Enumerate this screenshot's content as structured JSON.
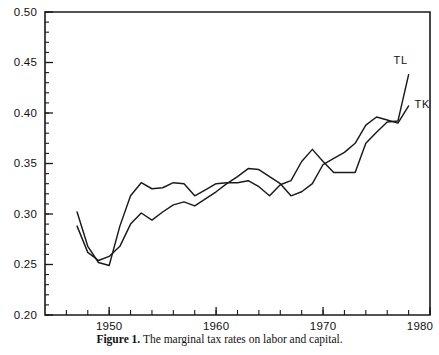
{
  "figure": {
    "caption_label": "Figure 1.",
    "caption_text": "The marginal tax rates on labor and capital."
  },
  "chart_data": {
    "type": "line",
    "title": "",
    "xlabel": "",
    "ylabel": "",
    "xlim": [
      1944,
      1980
    ],
    "ylim": [
      0.2,
      0.5
    ],
    "grid": false,
    "legend_position": "inline-right-end-labels",
    "y_ticks": [
      0.2,
      0.25,
      0.3,
      0.35,
      0.4,
      0.45,
      0.5
    ],
    "y_tick_labels": [
      "0.20",
      "0.25",
      "0.30",
      "0.35",
      "0.40",
      "0.45",
      "0.50"
    ],
    "y_minor_tick_step": 0.01,
    "x_ticks": [
      1950,
      1960,
      1970,
      1980
    ],
    "x_tick_labels": [
      "1950",
      "1960",
      "1970",
      "1980"
    ],
    "x_minor_tick_step": 2,
    "x": [
      1947,
      1948,
      1949,
      1950,
      1951,
      1952,
      1953,
      1954,
      1955,
      1956,
      1957,
      1958,
      1959,
      1960,
      1961,
      1962,
      1963,
      1964,
      1965,
      1966,
      1967,
      1968,
      1969,
      1970,
      1971,
      1972,
      1973,
      1974,
      1975,
      1976,
      1977,
      1978
    ],
    "series": [
      {
        "name": "TL",
        "label": "TL",
        "values": [
          0.302,
          0.268,
          0.252,
          0.249,
          0.288,
          0.318,
          0.331,
          0.325,
          0.326,
          0.331,
          0.33,
          0.318,
          0.324,
          0.33,
          0.331,
          0.331,
          0.333,
          0.327,
          0.318,
          0.329,
          0.333,
          0.352,
          0.364,
          0.352,
          0.341,
          0.341,
          0.341,
          0.37,
          0.381,
          0.391,
          0.392,
          0.438
        ]
      },
      {
        "name": "TK",
        "label": "TK",
        "values": [
          0.288,
          0.262,
          0.254,
          0.258,
          0.268,
          0.29,
          0.301,
          0.294,
          0.302,
          0.309,
          0.312,
          0.308,
          0.315,
          0.322,
          0.33,
          0.337,
          0.345,
          0.344,
          0.337,
          0.33,
          0.318,
          0.322,
          0.33,
          0.349,
          0.355,
          0.361,
          0.37,
          0.388,
          0.396,
          0.393,
          0.39,
          0.407
        ]
      }
    ]
  }
}
